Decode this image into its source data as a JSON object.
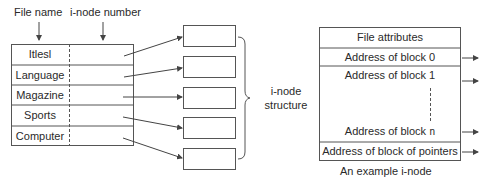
{
  "directory": {
    "header_file_name": "File name",
    "header_inode_number": "i-node number",
    "rows": [
      {
        "name": "Itlesl"
      },
      {
        "name": "Language"
      },
      {
        "name": "Magazine"
      },
      {
        "name": "Sports"
      },
      {
        "name": "Computer"
      }
    ]
  },
  "inode_structure": {
    "label_line1": "i-node",
    "label_line2": "structure",
    "box_count": 5
  },
  "example_inode": {
    "rows": {
      "attributes": "File attributes",
      "block0": "Address of block 0",
      "block1": "Address of block 1",
      "blockn_prefix": "Address of block ",
      "blockn_suffix": "n",
      "pointers": "Address of block of pointers"
    },
    "caption": "An example i-node"
  },
  "colors": {
    "line": "#555555",
    "text": "#2a2a2a"
  }
}
